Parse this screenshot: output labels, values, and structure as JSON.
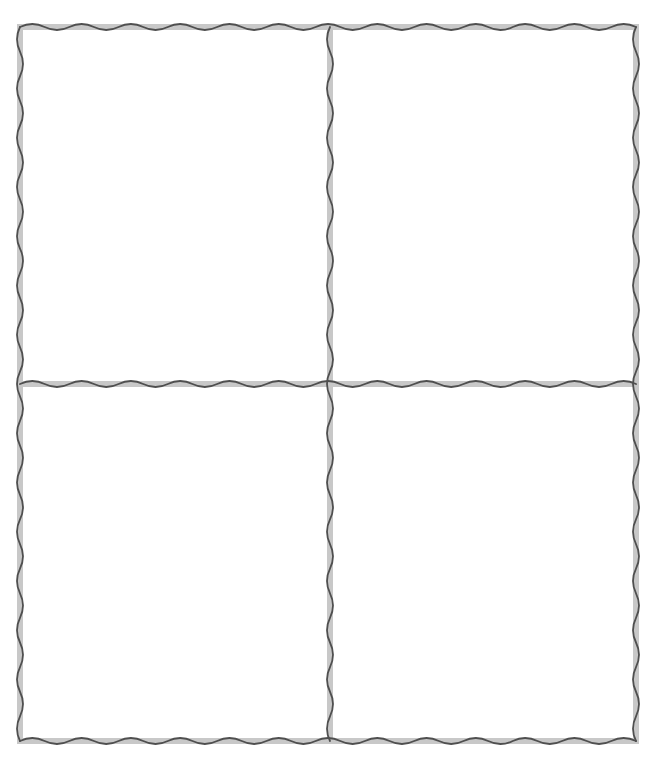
{
  "layout": {
    "type": "grid",
    "rows": 2,
    "columns": 2,
    "frame": {
      "left": 20,
      "top": 27,
      "right": 636,
      "bottom": 741
    },
    "divider_x": 330,
    "divider_y": 384
  },
  "style": {
    "background": "#ffffff",
    "band_color": "#c8c8c8",
    "line_color": "#4f4f4f",
    "band_width": 6,
    "line_width": 1.8,
    "wave_period": 25,
    "wave_amplitude": 3
  },
  "cells": [
    {
      "id": "top-left",
      "content": ""
    },
    {
      "id": "top-right",
      "content": ""
    },
    {
      "id": "bottom-left",
      "content": ""
    },
    {
      "id": "bottom-right",
      "content": ""
    }
  ]
}
